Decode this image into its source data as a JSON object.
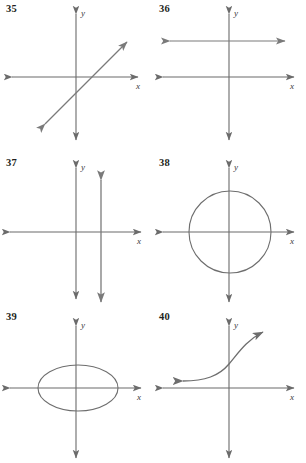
{
  "page": {
    "background": "#ffffff",
    "width": 306,
    "height": 463,
    "axis_color": "#6b6b6b",
    "curve_color": "#6e6e6e",
    "label_color": "#231f20"
  },
  "axis_labels": {
    "x": "x",
    "y": "y"
  },
  "panels": [
    {
      "number": "35",
      "graph_type": "line-diagonal",
      "description": "Straight line with positive slope, arrows at both ends, crossing x-axis right of origin"
    },
    {
      "number": "36",
      "graph_type": "line-horizontal",
      "description": "Horizontal line above the x-axis with arrows at both ends"
    },
    {
      "number": "37",
      "graph_type": "line-vertical",
      "description": "Vertical line right of the y-axis with arrows at both ends"
    },
    {
      "number": "38",
      "graph_type": "circle",
      "description": "Circle centered at the origin"
    },
    {
      "number": "39",
      "graph_type": "ellipse",
      "description": "Horizontally elongated ellipse centered at the origin"
    },
    {
      "number": "40",
      "graph_type": "exponential-curve",
      "description": "Increasing exponential-like curve with arrows at both ends"
    }
  ]
}
